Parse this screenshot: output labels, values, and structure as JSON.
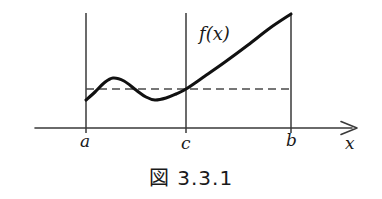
{
  "figure": {
    "caption_prefix": "図",
    "caption_number": "3.3.1",
    "caption_full": "図 3.3.1",
    "curve_label": "f(x)",
    "axis_label_x": "x",
    "tick_labels": {
      "a": "a",
      "c": "c",
      "b": "b"
    },
    "colors": {
      "ink": "#1a1a1a",
      "axis": "#3a3a3a",
      "curve": "#111111",
      "dashed": "#4a4a4a",
      "background": "#ffffff"
    }
  },
  "chart_data": {
    "type": "line",
    "title": "図 3.3.1",
    "xlabel": "x",
    "ylabel": "",
    "grid": false,
    "legend": null,
    "annotations": [
      {
        "text": "f(x)",
        "x": 200,
        "y": 38,
        "role": "curve-label"
      },
      {
        "text": "a",
        "x": 86,
        "y": 140,
        "role": "x-tick-label"
      },
      {
        "text": "c",
        "x": 186,
        "y": 140,
        "role": "x-tick-label"
      },
      {
        "text": "b",
        "x": 291,
        "y": 140,
        "role": "x-tick-label"
      },
      {
        "text": "x",
        "x": 352,
        "y": 142,
        "role": "axis-label"
      }
    ],
    "axis": {
      "x_axis_y": 128,
      "x_axis_start": 35,
      "x_axis_end": 357,
      "arrow": "right"
    },
    "vertical_lines": [
      {
        "name": "a",
        "x": 86,
        "y_top": 13,
        "y_bottom": 133
      },
      {
        "name": "c",
        "x": 186,
        "y_top": 13,
        "y_bottom": 133
      },
      {
        "name": "b",
        "x": 291,
        "y_top": 13,
        "y_bottom": 133
      }
    ],
    "dashed_line": {
      "y": 89,
      "x_start": 86,
      "x_end": 291,
      "dash": "8 5",
      "meaning": "horizontal level line f(a) = f(c)"
    },
    "curve_points": [
      {
        "x": 86,
        "y": 100
      },
      {
        "x": 95,
        "y": 92
      },
      {
        "x": 104,
        "y": 83
      },
      {
        "x": 113,
        "y": 78
      },
      {
        "x": 124,
        "y": 81
      },
      {
        "x": 136,
        "y": 90
      },
      {
        "x": 146,
        "y": 97
      },
      {
        "x": 155,
        "y": 100
      },
      {
        "x": 166,
        "y": 98
      },
      {
        "x": 176,
        "y": 94
      },
      {
        "x": 186,
        "y": 89
      },
      {
        "x": 205,
        "y": 76
      },
      {
        "x": 225,
        "y": 62
      },
      {
        "x": 248,
        "y": 45
      },
      {
        "x": 270,
        "y": 28
      },
      {
        "x": 291,
        "y": 14
      }
    ],
    "key_features": [
      {
        "label": "start",
        "x": 86,
        "y": 100
      },
      {
        "label": "local-maximum",
        "x": 113,
        "y": 78
      },
      {
        "label": "local-minimum",
        "x": 155,
        "y": 100
      },
      {
        "label": "crossing-at-c",
        "x": 186,
        "y": 89
      },
      {
        "label": "end",
        "x": 291,
        "y": 14
      }
    ]
  }
}
